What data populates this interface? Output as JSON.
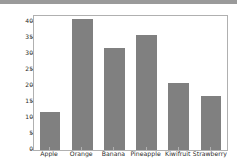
{
  "chart_data": {
    "type": "bar",
    "title": "",
    "xlabel": "",
    "ylabel": "",
    "categories": [
      "Apple",
      "Orange",
      "Banana",
      "Pineapple",
      "Kiwifruit",
      "Strawberry"
    ],
    "values": [
      12,
      41,
      32,
      36,
      21,
      17
    ],
    "ylim": [
      0,
      42
    ],
    "yticks": [
      0,
      5,
      10,
      15,
      20,
      25,
      30,
      35,
      40
    ],
    "ytick_labels": [
      "0",
      "5",
      "10",
      "15",
      "20",
      "25",
      "30",
      "35",
      "40"
    ],
    "grid": false,
    "legend": false,
    "bar_color": "#808080",
    "axes_color": "#b0b0b0",
    "background": "#ffffff",
    "top_band_color": "#9a9a9a"
  }
}
